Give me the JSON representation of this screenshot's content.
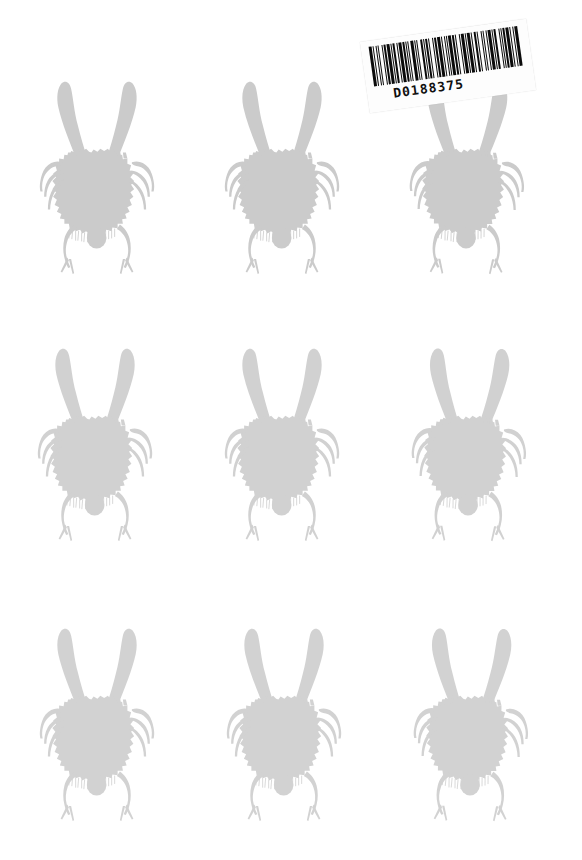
{
  "page": {
    "width": 582,
    "height": 860,
    "background_color": "#ffffff"
  },
  "palette": {
    "background": "#ffffff",
    "specimen_body": "#cbcbcb",
    "specimen_body_light": "#d4d4d4",
    "specimen_limb": "#d0d0d0",
    "barcode_bar": "#0b0b0b",
    "barcode_label": "#fdfdfd",
    "barcode_text": "#101010"
  },
  "specimen": {
    "name": "beetle-silhouette",
    "description": "Stylized horned beetle silhouette with two curved horns, ragged round body, six thin side legs, two forked rear legs and a rounded abdomen.",
    "parts": [
      "left-horn",
      "right-horn",
      "body",
      "left-legs",
      "right-legs",
      "rear-legs",
      "abdomen"
    ]
  },
  "grid": {
    "rows": 3,
    "columns": 3,
    "count": 9,
    "items": [
      {
        "id": "specimen-1",
        "row": 1,
        "column": 1,
        "x": 12,
        "y": 58,
        "opacity": 1.0,
        "rotate": 0.0,
        "scale": 1.0
      },
      {
        "id": "specimen-2",
        "row": 1,
        "column": 2,
        "x": 197,
        "y": 58,
        "opacity": 1.0,
        "rotate": 0.0,
        "scale": 1.0
      },
      {
        "id": "specimen-3",
        "row": 1,
        "column": 3,
        "x": 382,
        "y": 58,
        "opacity": 1.0,
        "rotate": 0.5,
        "scale": 1.0
      },
      {
        "id": "specimen-4",
        "row": 2,
        "column": 1,
        "x": 10,
        "y": 325,
        "opacity": 0.88,
        "rotate": 0.0,
        "scale": 1.0
      },
      {
        "id": "specimen-5",
        "row": 2,
        "column": 2,
        "x": 197,
        "y": 325,
        "opacity": 0.88,
        "rotate": 0.0,
        "scale": 1.0
      },
      {
        "id": "specimen-6",
        "row": 2,
        "column": 3,
        "x": 384,
        "y": 325,
        "opacity": 0.88,
        "rotate": 0.5,
        "scale": 1.0
      },
      {
        "id": "specimen-7",
        "row": 3,
        "column": 1,
        "x": 12,
        "y": 605,
        "opacity": 0.86,
        "rotate": 0.0,
        "scale": 1.0
      },
      {
        "id": "specimen-8",
        "row": 3,
        "column": 2,
        "x": 199,
        "y": 605,
        "opacity": 0.86,
        "rotate": 0.0,
        "scale": 1.0
      },
      {
        "id": "specimen-9",
        "row": 3,
        "column": 3,
        "x": 386,
        "y": 605,
        "opacity": 0.86,
        "rotate": 0.5,
        "scale": 1.0
      }
    ]
  },
  "barcode": {
    "value": "D0188375",
    "human_readable_text": "D0188375",
    "symbology": "code-39",
    "rotation_degrees": -8,
    "position": {
      "x": 364,
      "y": 30,
      "width": 168,
      "height": 72
    },
    "bar_pattern": [
      3,
      1,
      1,
      2,
      1,
      1,
      1,
      3,
      1,
      1,
      2,
      1,
      3,
      1,
      1,
      1,
      2,
      2,
      1,
      1,
      3,
      1,
      2,
      1,
      1,
      1,
      1,
      2,
      3,
      1,
      1,
      1,
      1,
      3,
      2,
      1,
      1,
      1,
      2,
      1,
      1,
      3,
      1,
      1,
      2,
      1,
      3,
      1,
      1,
      2,
      1,
      1,
      1,
      1,
      3,
      1,
      2,
      1,
      1,
      3,
      1,
      1,
      2,
      1,
      1,
      1,
      3,
      1,
      1,
      2,
      2,
      1,
      1,
      3,
      1,
      1,
      1,
      2,
      1,
      1,
      3,
      1,
      1,
      1,
      2,
      3,
      1,
      1,
      1,
      1,
      2,
      1,
      3,
      1,
      1,
      2,
      1,
      1,
      3,
      1
    ]
  }
}
